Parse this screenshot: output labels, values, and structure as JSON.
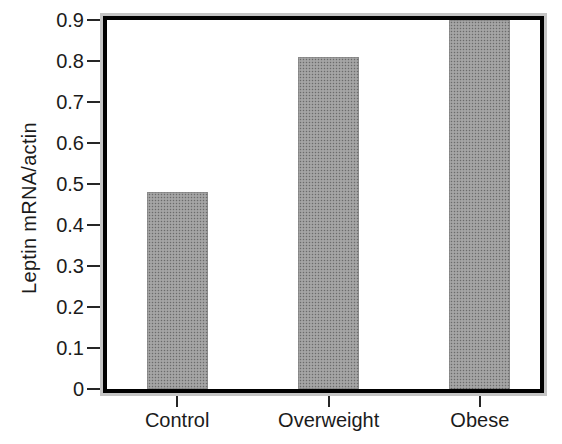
{
  "chart_data": {
    "type": "bar",
    "title": "",
    "xlabel": "",
    "ylabel": "Leptin mRNA/actin",
    "categories": [
      "Control",
      "Overweight",
      "Obese"
    ],
    "values": [
      0.48,
      0.81,
      0.9
    ],
    "ylim": [
      0,
      0.9
    ],
    "yticks": [
      0,
      0.1,
      0.2,
      0.3,
      0.4,
      0.5,
      0.6,
      0.7,
      0.8,
      0.9
    ],
    "ytick_labels": [
      "0",
      "0.1",
      "0.2",
      "0.3",
      "0.4",
      "0.5",
      "0.6",
      "0.7",
      "0.8",
      "0.9"
    ],
    "grid": false,
    "legend": "none",
    "colors": {
      "bar_fill": "#9b9b9b",
      "frame_outer": "#c4c4c4",
      "frame_inner": "#000000",
      "text": "#1b1b1b",
      "background": "#ffffff"
    }
  }
}
